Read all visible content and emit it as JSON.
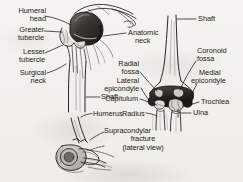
{
  "figure": {
    "background_color": "#f4f2ee",
    "ink_color": "#1b1b1b",
    "views": [
      {
        "name": "proximal-humerus-anterior",
        "caption": ""
      },
      {
        "name": "distal-humerus-anterior",
        "caption": ""
      },
      {
        "name": "supracondylar-fracture-lateral",
        "caption": "Supracondylar fracture (lateral view)"
      }
    ]
  },
  "labels": {
    "humeral_head": {
      "line1": "Humeral",
      "line2": "head"
    },
    "greater_tubercle": {
      "line1": "Greater",
      "line2": "tubercle"
    },
    "lesser_tubercle": {
      "line1": "Lesser",
      "line2": "tubercle"
    },
    "surgical_neck": {
      "line1": "Surgical",
      "line2": "neck"
    },
    "anatomic_neck": {
      "line1": "Anatomic",
      "line2": "neck"
    },
    "shaft_left": {
      "line1": "Shaft"
    },
    "humerus": {
      "line1": "Humerus"
    },
    "shaft_right": {
      "line1": "Shaft"
    },
    "radial_fossa": {
      "line1": "Radial",
      "line2": "fossa"
    },
    "lateral_epicondyle": {
      "line1": "Lateral",
      "line2": "epicondyle"
    },
    "capitulum": {
      "line1": "Capitulum"
    },
    "radius": {
      "line1": "Radius"
    },
    "coronoid_fossa": {
      "line1": "Coronoid",
      "line2": "fossa"
    },
    "medial_epicondyle": {
      "line1": "Medial",
      "line2": "epicondyle"
    },
    "trochlea": {
      "line1": "Trochlea"
    },
    "ulna": {
      "line1": "Ulna"
    },
    "supracondylar_fracture": {
      "line1": "Supracondylar",
      "line2": "fracture",
      "line3": "(lateral view)"
    }
  }
}
